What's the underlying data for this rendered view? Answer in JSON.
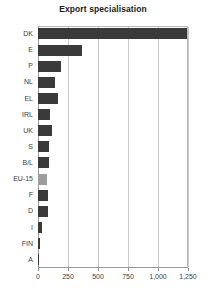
{
  "chart_data": {
    "type": "bar",
    "orientation": "horizontal",
    "title": "Export specialisation",
    "xlabel": "",
    "ylabel": "",
    "categories": [
      "DK",
      "E",
      "P",
      "NL",
      "EL",
      "IRL",
      "UK",
      "S",
      "B/L",
      "EU-15",
      "F",
      "D",
      "I",
      "FIN",
      "A"
    ],
    "values": [
      1240,
      370,
      195,
      140,
      170,
      100,
      115,
      95,
      90,
      75,
      85,
      80,
      30,
      15,
      10
    ],
    "series": [
      {
        "name": "Export specialisation",
        "values": [
          1240,
          370,
          195,
          140,
          170,
          100,
          115,
          95,
          90,
          75,
          85,
          80,
          30,
          15,
          10
        ]
      }
    ],
    "highlight_category": "EU-15",
    "xlim": [
      0,
      1250
    ],
    "xticks": [
      0,
      250,
      500,
      750,
      1000,
      1250
    ],
    "xticklabels": [
      "0",
      "250",
      "500",
      "750",
      "1,000",
      "1,250"
    ],
    "grid": "vertical",
    "legend": "none",
    "colors": {
      "bar": "#3a3a3a",
      "bar_highlight": "#9d9d9d",
      "gridline": "#c9c9c9",
      "axis": "#9a9a9a",
      "text": "#3c3c3c",
      "title": "#1a1a1a",
      "background": "#ffffff"
    }
  }
}
